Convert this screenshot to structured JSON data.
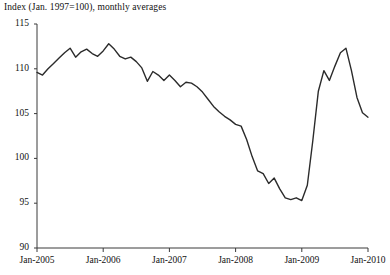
{
  "chart_data": {
    "type": "line",
    "title": "Index  (Jan. 1997=100), monthly averages",
    "xlabel": "",
    "ylabel": "",
    "ylim": [
      90,
      115
    ],
    "ytick_labels": [
      "115",
      "110",
      "105",
      "100",
      "95",
      "90"
    ],
    "ytick_values": [
      115,
      110,
      105,
      100,
      95,
      90
    ],
    "xtick_labels": [
      "Jan-2005",
      "Jan-2006",
      "Jan-2007",
      "Jan-2008",
      "Jan-2009",
      "Jan-2010"
    ],
    "xtick_values": [
      "2005-01",
      "2006-01",
      "2007-01",
      "2008-01",
      "2009-01",
      "2010-01"
    ],
    "xlim": [
      "2005-01",
      "2010-01"
    ],
    "grid": false,
    "legend": null,
    "line_color": "#2b2b2b",
    "line_width": 1.4,
    "series": [
      {
        "name": "Index (Jan. 1997=100), monthly averages",
        "x": [
          "2005-01",
          "2005-02",
          "2005-03",
          "2005-04",
          "2005-05",
          "2005-06",
          "2005-07",
          "2005-08",
          "2005-09",
          "2005-10",
          "2005-11",
          "2005-12",
          "2006-01",
          "2006-02",
          "2006-03",
          "2006-04",
          "2006-05",
          "2006-06",
          "2006-07",
          "2006-08",
          "2006-09",
          "2006-10",
          "2006-11",
          "2006-12",
          "2007-01",
          "2007-02",
          "2007-03",
          "2007-04",
          "2007-05",
          "2007-06",
          "2007-07",
          "2007-08",
          "2007-09",
          "2007-10",
          "2007-11",
          "2007-12",
          "2008-01",
          "2008-02",
          "2008-03",
          "2008-04",
          "2008-05",
          "2008-06",
          "2008-07",
          "2008-08",
          "2008-09",
          "2008-10",
          "2008-11",
          "2008-12",
          "2009-01",
          "2009-02",
          "2009-03",
          "2009-04",
          "2009-05",
          "2009-06",
          "2009-07",
          "2009-08",
          "2009-09",
          "2009-10",
          "2009-11",
          "2009-12",
          "2010-01"
        ],
        "values": [
          109.6,
          109.3,
          110.0,
          110.6,
          111.2,
          111.8,
          112.3,
          111.3,
          111.9,
          112.2,
          111.7,
          111.4,
          112.0,
          112.8,
          112.2,
          111.4,
          111.1,
          111.3,
          110.8,
          110.1,
          108.6,
          109.7,
          109.3,
          108.7,
          109.3,
          108.7,
          108.0,
          108.5,
          108.4,
          108.0,
          107.4,
          106.6,
          105.8,
          105.2,
          104.7,
          104.3,
          103.8,
          103.6,
          102.1,
          100.2,
          98.6,
          98.3,
          97.2,
          97.8,
          96.6,
          95.6,
          95.4,
          95.6,
          95.3,
          97.0,
          102.0,
          107.5,
          109.8,
          108.7,
          110.3,
          111.8,
          112.3,
          109.8,
          106.8,
          105.1,
          104.6
        ]
      }
    ],
    "annotations": [
      {
        "text": "peak 2006",
        "value": 112.8
      },
      {
        "text": "trough mid-2008",
        "value": 95.3
      },
      {
        "text": "peak 2009",
        "value": 112.3
      }
    ]
  },
  "axis": {
    "y_min_label": "90",
    "y_max_label": "115"
  }
}
